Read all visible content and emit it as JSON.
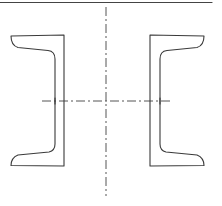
{
  "drawing": {
    "title": "",
    "description": "Two channel sections placed back-to-back (opening outward) with symmetric axes",
    "colors": {
      "line": "#3a3a3a",
      "centerline": "#555555",
      "background": "#ffffff"
    },
    "elements": [
      {
        "name": "top-border-line",
        "type": "line"
      },
      {
        "name": "vertical-centerline",
        "type": "dash-dot line"
      },
      {
        "name": "horizontal-centerline",
        "type": "dash-dot line"
      },
      {
        "name": "left-channel-section",
        "type": "channel profile",
        "flange_direction": "left"
      },
      {
        "name": "right-channel-section",
        "type": "channel profile",
        "flange_direction": "right"
      }
    ]
  }
}
